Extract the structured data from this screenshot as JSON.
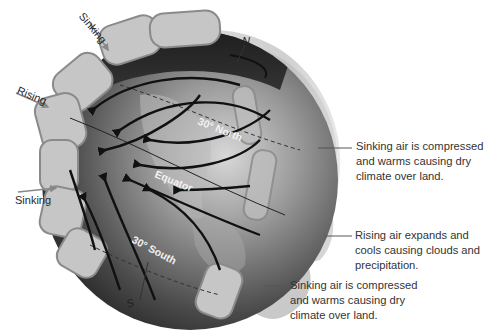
{
  "diagram": {
    "side_labels": {
      "top": "Sinking",
      "middle": "Rising",
      "bottom": "Sinking"
    },
    "globe_labels": {
      "north_pole": "N",
      "south_pole": "S",
      "lat_30n": "30° North",
      "equator": "Equator",
      "lat_30s": "30° South"
    },
    "captions": [
      {
        "id": "caption-30n",
        "text": "Sinking air is compressed and warms causing dry climate over land."
      },
      {
        "id": "caption-equator",
        "text": "Rising air expands and cools causing clouds and precipitation."
      },
      {
        "id": "caption-30s",
        "text": "Sinking air is compressed and warms causing dry climate over land."
      }
    ],
    "colors": {
      "background": "#ffffff",
      "globe_dark": "#2b2b2b",
      "globe_light": "#b5b5b5",
      "cell_fill": "#c9c9c9",
      "cell_edge": "#8a8a8a",
      "text": "#2a2a2a"
    }
  }
}
